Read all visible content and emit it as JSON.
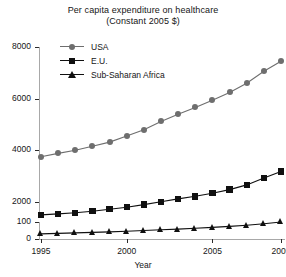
{
  "chart_data": {
    "type": "line",
    "title": "Per capita expenditure on healthcare",
    "subtitle": "(Constant 2005 $)",
    "xlabel": "Year",
    "ylabel": "",
    "x": [
      1995,
      1996,
      1997,
      1998,
      1999,
      2000,
      2001,
      2002,
      2003,
      2004,
      2005,
      2006,
      2007,
      2008,
      2009
    ],
    "xticks": [
      1995,
      2000,
      2005,
      2009
    ],
    "xlim": [
      1995,
      2009
    ],
    "grid": false,
    "legend_position": "top-left",
    "axis_break": true,
    "yticks_lower": [
      0,
      100
    ],
    "yticks_upper": [
      2000,
      4000,
      6000,
      8000
    ],
    "ylim_lower": [
      0,
      100
    ],
    "ylim_upper": [
      1000,
      8000
    ],
    "series": [
      {
        "name": "USA",
        "marker": "circle",
        "color": "#6e6e6e",
        "values": [
          3750,
          3880,
          4000,
          4160,
          4320,
          4560,
          4800,
          5120,
          5400,
          5660,
          5940,
          6240,
          6600,
          7060,
          7450
        ]
      },
      {
        "name": "E.U.",
        "marker": "square",
        "color": "#101010",
        "values": [
          1500,
          1540,
          1580,
          1640,
          1720,
          1800,
          1900,
          2010,
          2120,
          2220,
          2340,
          2480,
          2660,
          2930,
          3180
        ]
      },
      {
        "name": "Sub-Saharan Africa",
        "marker": "triangle",
        "color": "#101010",
        "values": [
          30,
          33,
          36,
          39,
          42,
          46,
          50,
          54,
          58,
          63,
          68,
          74,
          81,
          90,
          100
        ]
      }
    ]
  },
  "axes": {
    "axis_color": "#a8a8a8",
    "tick_color": "#2b2b2b"
  }
}
